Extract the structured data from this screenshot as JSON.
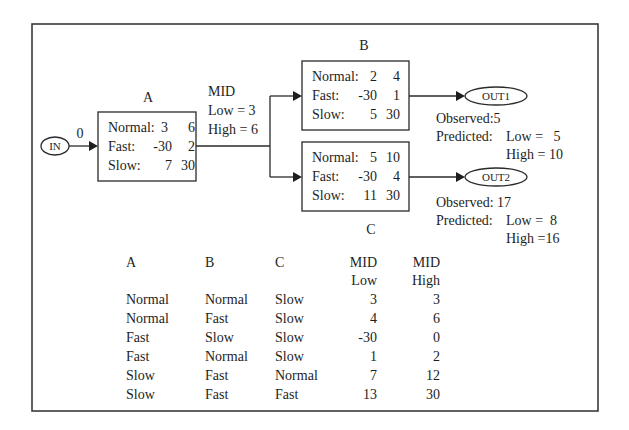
{
  "diagram": {
    "input": {
      "label": "IN",
      "edge_value": "0"
    },
    "nodes": [
      {
        "id": "A",
        "title": "A",
        "rows": [
          {
            "state": "Normal:",
            "low": "3",
            "high": "6"
          },
          {
            "state": "Fast:",
            "low": "-30",
            "high": "2"
          },
          {
            "state": "Slow:",
            "low": "7",
            "high": "30"
          }
        ]
      },
      {
        "id": "B",
        "title": "B",
        "rows": [
          {
            "state": "Normal:",
            "low": "2",
            "high": "4"
          },
          {
            "state": "Fast:",
            "low": "-30",
            "high": "1"
          },
          {
            "state": "Slow:",
            "low": "5",
            "high": "30"
          }
        ]
      },
      {
        "id": "C",
        "title": "C",
        "rows": [
          {
            "state": "Normal:",
            "low": "5",
            "high": "10"
          },
          {
            "state": "Fast:",
            "low": "-30",
            "high": "4"
          },
          {
            "state": "Slow:",
            "low": "11",
            "high": "30"
          }
        ]
      }
    ],
    "mid": {
      "title": "MID",
      "low": "Low = 3",
      "high": "High = 6"
    },
    "outputs": [
      {
        "label": "OUT1",
        "observed": "Observed:5",
        "predicted_label": "Predicted:",
        "low": "Low =   5",
        "high": "High = 10"
      },
      {
        "label": "OUT2",
        "observed": "Observed: 17",
        "predicted_label": "Predicted:",
        "low": "Low =  8",
        "high": "High =16"
      }
    ]
  },
  "table": {
    "headers": [
      {
        "line1": "A",
        "line2": ""
      },
      {
        "line1": "B",
        "line2": ""
      },
      {
        "line1": "C",
        "line2": ""
      },
      {
        "line1": "MID",
        "line2": "Low"
      },
      {
        "line1": "MID",
        "line2": "High"
      }
    ],
    "rows": [
      [
        "Normal",
        "Normal",
        "Slow",
        "3",
        "3"
      ],
      [
        "Normal",
        "Fast",
        "Slow",
        "4",
        "6"
      ],
      [
        "Fast",
        "Slow",
        "Slow",
        "-30",
        "0"
      ],
      [
        "Fast",
        "Normal",
        "Slow",
        "1",
        "2"
      ],
      [
        "Slow",
        "Fast",
        "Normal",
        "7",
        "12"
      ],
      [
        "Slow",
        "Fast",
        "Fast",
        "13",
        "30"
      ]
    ]
  }
}
